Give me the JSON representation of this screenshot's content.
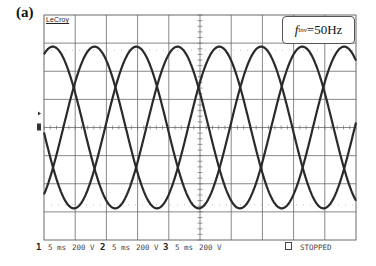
{
  "panel_label": "(a)",
  "oscilloscope": {
    "brand": "LeCroy",
    "freq_label": {
      "symbol": "f",
      "subscript": "inv",
      "value": "=50Hz"
    },
    "status": {
      "channels": [
        {
          "num": "1",
          "timebase": "5 ms",
          "volts": "200 V"
        },
        {
          "num": "2",
          "timebase": "5 ms",
          "volts": "200 V"
        },
        {
          "num": "3",
          "timebase": "5 ms",
          "volts": "200 V"
        }
      ],
      "run_state": "STOPPED",
      "run_state_icon": "square-icon"
    },
    "trace_color": "#2a2a2a",
    "grid_color": "#6a6a6a"
  },
  "chart_data": {
    "type": "line",
    "annotation": "f_inv=50Hz",
    "xlabel": "time (5 ms/div)",
    "ylabel": "voltage (200 V/div)",
    "x_divisions": 10,
    "y_divisions": 8,
    "grid": true,
    "xlim_ms": [
      0,
      50
    ],
    "ylim_V": [
      -800,
      800
    ],
    "frequency_hz": 50,
    "period_ms": 20,
    "series": [
      {
        "name": "Phase 1",
        "amplitude_V": 575,
        "peak_times_ms": [
          1.4,
          21.4,
          41.4
        ],
        "phase_deg": 0
      },
      {
        "name": "Phase 2",
        "amplitude_V": 575,
        "peak_times_ms": [
          8.1,
          28.1,
          48.1
        ],
        "phase_deg": -120
      },
      {
        "name": "Phase 3",
        "amplitude_V": 575,
        "peak_times_ms": [
          14.8,
          34.8
        ],
        "phase_deg": -240
      }
    ]
  }
}
